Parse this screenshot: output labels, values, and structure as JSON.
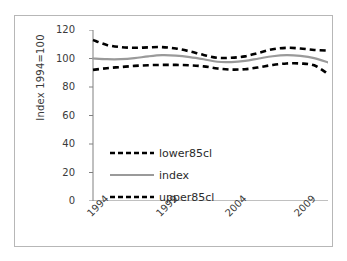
{
  "chart_data": {
    "type": "line",
    "title": "",
    "xlabel": "",
    "ylabel": "Index 1994=100",
    "ylim": [
      0,
      120
    ],
    "ytick_values": [
      0,
      20,
      40,
      60,
      80,
      100,
      120
    ],
    "ytick_labels": [
      "0",
      "20",
      "40",
      "60",
      "80",
      "100",
      "120"
    ],
    "xlim": [
      1994,
      2011
    ],
    "xtick_values": [
      1994,
      1999,
      2004,
      2009
    ],
    "xtick_labels": [
      "1994",
      "1999",
      "2004",
      "2009"
    ],
    "xtick_minor_values": [
      1994,
      1995,
      1996,
      1997,
      1998,
      1999,
      2000,
      2001,
      2002,
      2003,
      2004,
      2005,
      2006,
      2007,
      2008,
      2009,
      2010,
      2011
    ],
    "grid": false,
    "legend_position": "center-left",
    "x": [
      1994,
      1995,
      1996,
      1997,
      1998,
      1999,
      2000,
      2001,
      2002,
      2003,
      2004,
      2005,
      2006,
      2007,
      2008,
      2009,
      2010,
      2011
    ],
    "series": [
      {
        "name": "upper85cl",
        "style": "dashed",
        "color": "#000000",
        "values": [
          113.0,
          109.5,
          108.0,
          107.5,
          107.8,
          108.0,
          107.0,
          105.0,
          102.5,
          100.5,
          100.5,
          101.5,
          104.0,
          106.5,
          107.5,
          107.0,
          106.0,
          105.5
        ]
      },
      {
        "name": "index",
        "style": "solid",
        "color": "#9a9a9a",
        "values": [
          100.0,
          99.5,
          99.5,
          100.2,
          101.5,
          102.3,
          102.0,
          101.0,
          99.5,
          97.7,
          97.5,
          98.3,
          100.0,
          101.6,
          102.3,
          101.8,
          100.3,
          97.2
        ]
      },
      {
        "name": "lower85cl",
        "style": "dashed",
        "color": "#000000",
        "values": [
          92.0,
          93.2,
          94.0,
          94.8,
          95.3,
          95.5,
          95.5,
          95.2,
          94.5,
          93.0,
          92.2,
          92.5,
          93.8,
          95.5,
          96.5,
          96.5,
          95.2,
          89.2
        ]
      }
    ],
    "legend": [
      {
        "label": "lower85cl",
        "style": "dashed",
        "color": "#000000"
      },
      {
        "label": "index",
        "style": "solid",
        "color": "#9a9a9a"
      },
      {
        "label": "upper85cl",
        "style": "dashed",
        "color": "#000000"
      }
    ],
    "colors": {
      "axis": "#808080",
      "text": "#3a3a3a",
      "frame": "#b7b7b7",
      "background": "#ffffff"
    }
  }
}
